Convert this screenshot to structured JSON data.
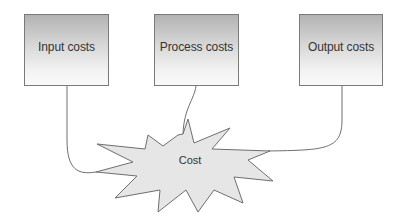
{
  "diagram": {
    "boxes": [
      {
        "id": "input",
        "label": "Input costs"
      },
      {
        "id": "process",
        "label": "Process costs"
      },
      {
        "id": "output",
        "label": "Output costs"
      }
    ],
    "center": {
      "label": "Cost",
      "shape": "starburst"
    },
    "connections": [
      {
        "from": "input",
        "to": "center"
      },
      {
        "from": "process",
        "to": "center"
      },
      {
        "from": "output",
        "to": "center"
      }
    ],
    "colors": {
      "box_border": "#7a7a7a",
      "box_gradient_top": "#b3b3b3",
      "box_gradient_bottom": "#fafafa",
      "burst_fill": "#e6e6e6",
      "line": "#6e6e6e",
      "text": "#333333"
    }
  }
}
